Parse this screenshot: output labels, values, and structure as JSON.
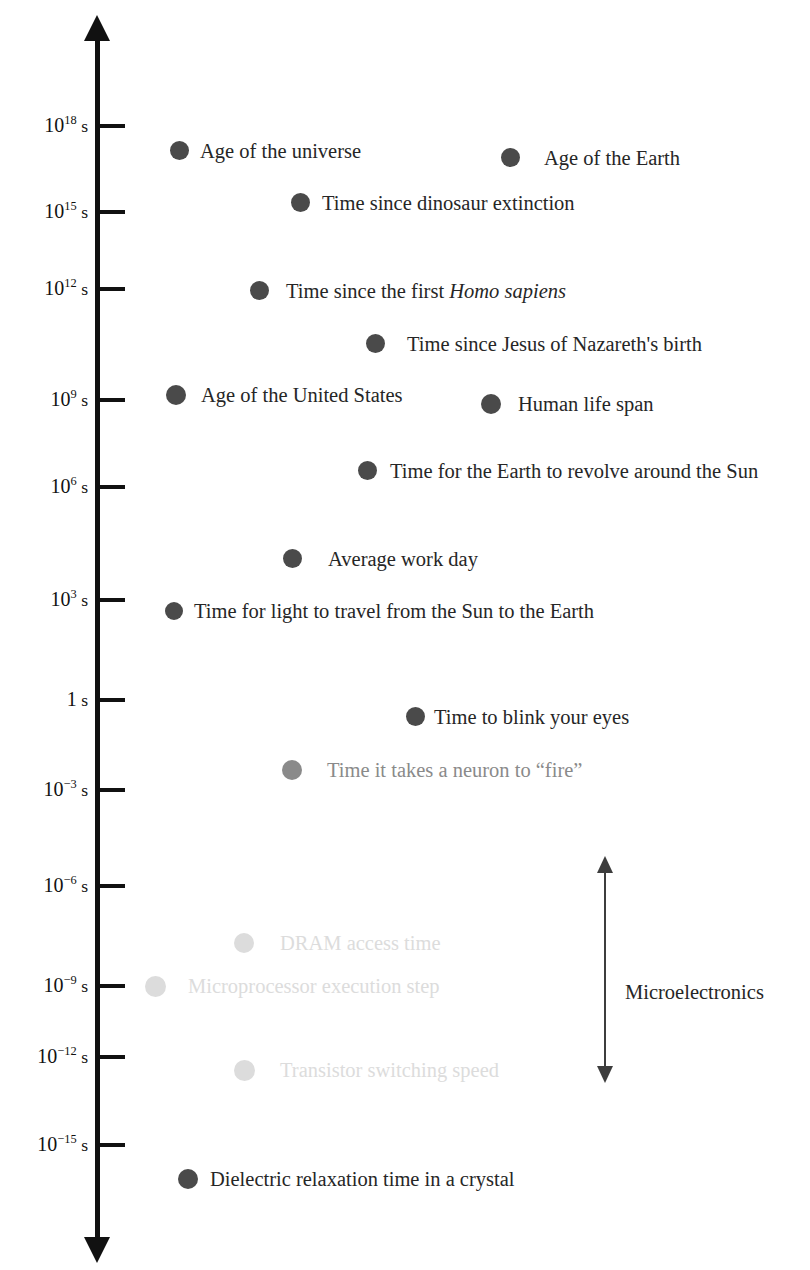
{
  "chart_data": {
    "type": "scatter",
    "title": "",
    "xlabel": "",
    "ylabel": "",
    "orientation": "vertical-log-timeline",
    "axis": {
      "unit": "s",
      "scale": "log10",
      "double_headed": true,
      "top_exponent": 19.6,
      "bottom_exponent": -16.6
    },
    "ticks": [
      {
        "label": "10",
        "exponent": "18",
        "unit": " s",
        "value_exponent": 18,
        "y": 126
      },
      {
        "label": "10",
        "exponent": "15",
        "unit": " s",
        "value_exponent": 15,
        "y": 212
      },
      {
        "label": "10",
        "exponent": "12",
        "unit": " s",
        "value_exponent": 12,
        "y": 289
      },
      {
        "label": "10",
        "exponent": "9",
        "unit": " s",
        "value_exponent": 9,
        "y": 400
      },
      {
        "label": "10",
        "exponent": "6",
        "unit": " s",
        "value_exponent": 6,
        "y": 487
      },
      {
        "label": "10",
        "exponent": "3",
        "unit": " s",
        "value_exponent": 3,
        "y": 600
      },
      {
        "label": "1",
        "exponent": "",
        "unit": " s",
        "value_exponent": 0,
        "y": 700
      },
      {
        "label": "10",
        "exponent": "−3",
        "unit": " s",
        "value_exponent": -3,
        "y": 790
      },
      {
        "label": "10",
        "exponent": "−6",
        "unit": " s",
        "value_exponent": -6,
        "y": 886
      },
      {
        "label": "10",
        "exponent": "−9",
        "unit": " s",
        "value_exponent": -9,
        "y": 986
      },
      {
        "label": "10",
        "exponent": "−12",
        "unit": " s",
        "value_exponent": -12,
        "y": 1057
      },
      {
        "label": "10",
        "exponent": "−15",
        "unit": " s",
        "value_exponent": -15,
        "y": 1145
      }
    ],
    "points": [
      {
        "label": "Age of the universe",
        "x": 170,
        "y": 150,
        "dot": 19,
        "gap": 11,
        "shade": "dark"
      },
      {
        "label": "Age of the Earth",
        "x": 501,
        "y": 157,
        "dot": 19,
        "gap": 24,
        "shade": "dark"
      },
      {
        "label": "Time since dinosaur extinction",
        "x": 291,
        "y": 202,
        "dot": 19,
        "gap": 12,
        "shade": "dark"
      },
      {
        "label": "Time since the first ",
        "label_italic": "Homo sapiens",
        "x": 250,
        "y": 290,
        "dot": 19,
        "gap": 17,
        "shade": "dark"
      },
      {
        "label": "Time since Jesus of Nazareth's birth",
        "x": 366,
        "y": 343,
        "dot": 19,
        "gap": 22,
        "shade": "dark"
      },
      {
        "label": "Age of the United States",
        "x": 166,
        "y": 395,
        "dot": 20,
        "gap": 15,
        "shade": "dark"
      },
      {
        "label": "Human life span",
        "x": 481,
        "y": 404,
        "dot": 20,
        "gap": 17,
        "shade": "dark"
      },
      {
        "label": "Time for the Earth to revolve around the Sun",
        "x": 358,
        "y": 470,
        "dot": 19,
        "gap": 13,
        "shade": "dark"
      },
      {
        "label": "Average work day",
        "x": 283,
        "y": 558,
        "dot": 19,
        "gap": 26,
        "shade": "dark"
      },
      {
        "label": "Time for light to travel from the Sun to the Earth",
        "x": 165,
        "y": 610,
        "dot": 18,
        "gap": 11,
        "shade": "dark"
      },
      {
        "label": "Time to blink your eyes",
        "x": 406,
        "y": 716,
        "dot": 19,
        "gap": 9,
        "shade": "dark"
      },
      {
        "label": "Time it takes a neuron to “fire”",
        "x": 282,
        "y": 770,
        "dot": 20,
        "gap": 25,
        "shade": "mid"
      },
      {
        "label": "DRAM access time",
        "x": 234,
        "y": 943,
        "dot": 20,
        "gap": 26,
        "shade": "faded"
      },
      {
        "label": "Microprocessor execution step",
        "x": 145,
        "y": 986,
        "dot": 21,
        "gap": 22,
        "shade": "faded"
      },
      {
        "label": "Transistor switching speed",
        "x": 234,
        "y": 1070,
        "dot": 21,
        "gap": 25,
        "shade": "faded"
      },
      {
        "label": "Dielectric relaxation time in a crystal",
        "x": 178,
        "y": 1179,
        "dot": 20,
        "gap": 12,
        "shade": "dark"
      }
    ],
    "annotations": [
      {
        "name": "microelectronics-range",
        "label": "Microelectronics",
        "arrow_x": 604,
        "arrow_top": 872,
        "arrow_bottom": 1067,
        "label_x": 625,
        "label_y": 992
      }
    ],
    "colors": {
      "axis": "#111111",
      "dot_dark": "#4a4a4a",
      "dot_mid": "#8a8a8a",
      "dot_faded": "#dcdcdc",
      "text_dark": "#262626",
      "text_mid": "#8a8a8a",
      "text_faded": "#dcdcdc",
      "bracket": "#3d3d3d",
      "background": "#ffffff"
    },
    "geometry": {
      "axis_x": 97,
      "axis_width": 5,
      "axis_top": 40,
      "axis_bottom": 1238,
      "tick_length": 26,
      "tick_label_right": 88
    }
  }
}
